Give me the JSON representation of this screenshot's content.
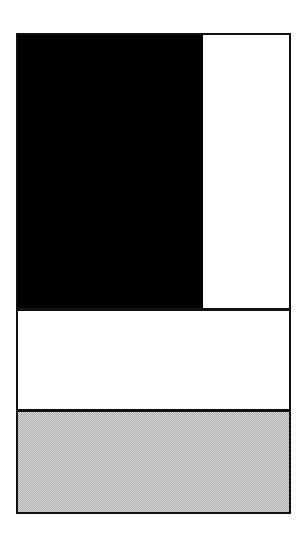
{
  "diagram": {
    "type": "layout-wireframe",
    "frame": {
      "border_color": "#111111"
    },
    "regions": [
      {
        "id": "top-left-block",
        "fill": "#000000"
      },
      {
        "id": "top-right-column",
        "fill": "#ffffff"
      },
      {
        "id": "middle-band",
        "fill": "#ffffff"
      },
      {
        "id": "bottom-band",
        "fill": "#c8c8c8",
        "pattern": "dithered"
      }
    ],
    "divider_color": "#111111",
    "gray_dither_light": "#dedede",
    "gray_dither_dark": "#a8a8a8"
  }
}
